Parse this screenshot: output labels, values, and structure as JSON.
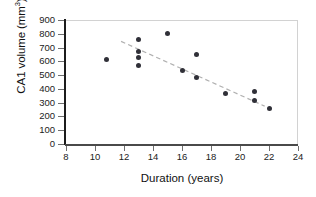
{
  "chart_data": {
    "type": "scatter",
    "title": "",
    "xlabel": "Duration (years)",
    "ylabel": "CA1 volume (mm3)",
    "ylabel_display": "CA1 volume (mm",
    "ylabel_superscript": "3",
    "ylabel_suffix": ")",
    "xlim": [
      8,
      24
    ],
    "ylim": [
      0,
      900
    ],
    "xticks": [
      8,
      10,
      12,
      14,
      16,
      18,
      20,
      22,
      24
    ],
    "yticks": [
      0,
      100,
      200,
      300,
      400,
      500,
      600,
      700,
      800,
      900
    ],
    "grid": false,
    "legend": null,
    "marker_color": "#303038",
    "trendline_color": "#b0b0b0",
    "trendline_style": "dashed",
    "points": [
      {
        "x": 10.8,
        "y": 610
      },
      {
        "x": 13.0,
        "y": 760
      },
      {
        "x": 13.0,
        "y": 675
      },
      {
        "x": 13.0,
        "y": 630
      },
      {
        "x": 13.0,
        "y": 570
      },
      {
        "x": 15.0,
        "y": 800
      },
      {
        "x": 16.0,
        "y": 530
      },
      {
        "x": 17.0,
        "y": 650
      },
      {
        "x": 17.0,
        "y": 480
      },
      {
        "x": 19.0,
        "y": 370
      },
      {
        "x": 21.0,
        "y": 380
      },
      {
        "x": 21.0,
        "y": 315
      },
      {
        "x": 22.0,
        "y": 255
      }
    ],
    "trendline": {
      "x1": 11.8,
      "y1": 745,
      "x2": 21.7,
      "y2": 275
    }
  }
}
